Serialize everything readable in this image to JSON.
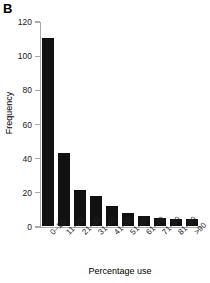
{
  "panel": {
    "label": "B"
  },
  "chart_data": {
    "type": "bar",
    "title": "",
    "xlabel": "Percentage use",
    "ylabel": "Frequency",
    "categories": [
      "0–10",
      "11–20",
      "21–30",
      "31–40",
      "41–50",
      "51–60",
      "61–70",
      "71–80",
      "81–90",
      ">90"
    ],
    "values": [
      111,
      44,
      22,
      19,
      13,
      9,
      7,
      6,
      5,
      5
    ],
    "ylim": [
      0,
      120
    ],
    "yticks": [
      0,
      20,
      40,
      60,
      80,
      100,
      120
    ],
    "ytick_labels": [
      "0",
      "20",
      "40",
      "60",
      "80",
      "100",
      "120"
    ],
    "grid": false,
    "legend": "none",
    "bar_color": "#111111"
  }
}
